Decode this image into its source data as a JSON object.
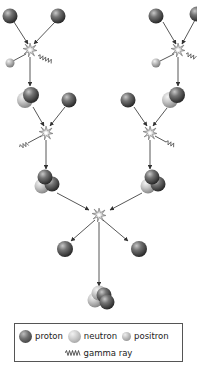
{
  "colors": {
    "proton": "#4a4a4a",
    "neutron": "#c6c6c6",
    "positron": "#b0b0b0",
    "arrow": "#444444",
    "legend_border": "#555555"
  },
  "legend": {
    "proton_label": "proton",
    "neutron_label": "neutron",
    "positron_label": "positron",
    "gamma_label": "gamma ray",
    "gamma_icon": "wavy-line-icon"
  },
  "stages": [
    {
      "name": "step-1",
      "description": "Two protons fuse into deuterium, emitting positron and gamma ray (left and right branches)"
    },
    {
      "name": "step-2",
      "description": "Deuterium plus proton fuse into helium-3, emitting gamma ray (left and right branches)"
    },
    {
      "name": "step-3",
      "description": "Two helium-3 nuclei fuse into helium-4, releasing two protons"
    }
  ]
}
